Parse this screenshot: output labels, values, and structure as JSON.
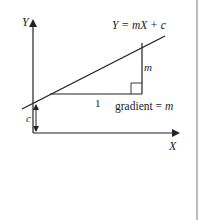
{
  "diagram": {
    "title": "",
    "axes": {
      "x_label": "X",
      "y_label": "Y"
    },
    "line_equation": "Y = mX + c",
    "run_label": "1",
    "rise_label": "m",
    "gradient_label": "gradient = m",
    "gradient_prefix": "gradient = ",
    "gradient_var": "m",
    "intercept_label": "c",
    "colors": {
      "stroke": "#222222",
      "background": "#ffffff",
      "edge": "#bbbbbb"
    }
  }
}
